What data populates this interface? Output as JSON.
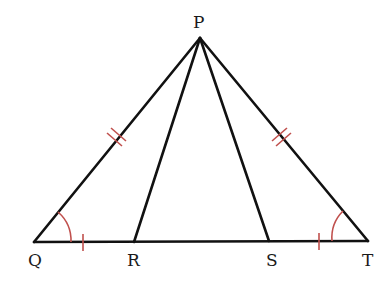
{
  "diagram": {
    "type": "geometry-triangle",
    "points": {
      "P": {
        "label": "P",
        "x": 200,
        "y": 38
      },
      "Q": {
        "label": "Q",
        "x": 34,
        "y": 242
      },
      "R": {
        "label": "R",
        "x": 134,
        "y": 242
      },
      "S": {
        "label": "S",
        "x": 269,
        "y": 241
      },
      "T": {
        "label": "T",
        "x": 368,
        "y": 241
      }
    },
    "segments": [
      "PQ",
      "PR",
      "PS",
      "PT",
      "QT"
    ],
    "markings": {
      "equal_sides_double_tick": [
        "PQ",
        "PT"
      ],
      "equal_sides_single_tick": [
        "QR",
        "ST"
      ],
      "equal_angles": [
        "PQR",
        "PTS"
      ]
    },
    "colors": {
      "line": "#111111",
      "mark": "#c0504d"
    }
  }
}
